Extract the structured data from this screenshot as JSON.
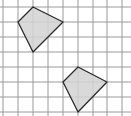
{
  "diagram": {
    "type": "grid-with-quadrilaterals",
    "grid": {
      "vertical_lines_x": [
        3,
        18,
        33,
        48,
        63,
        78,
        93,
        107,
        122
      ],
      "horizontal_lines_y": [
        7,
        22,
        37,
        52,
        67,
        82,
        97,
        112
      ],
      "line_color": "#9a9a9a"
    },
    "shapes": [
      {
        "name": "quadrilateral-upper-left",
        "points": "33,7 63,22 33,52 18,22",
        "fill": "#d2d2d2",
        "stroke": "#2a2a2a"
      },
      {
        "name": "quadrilateral-lower-right",
        "points": "78,67 107,82 78,112 63,82",
        "fill": "#d2d2d2",
        "stroke": "#2a2a2a"
      }
    ]
  }
}
